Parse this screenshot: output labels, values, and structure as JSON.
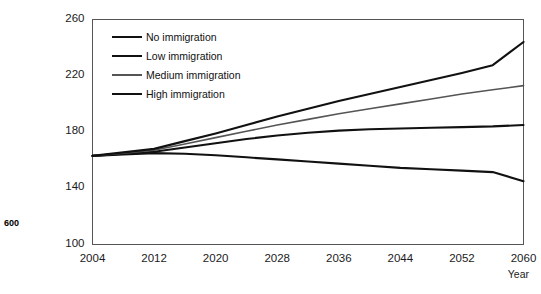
{
  "side_note": "600",
  "chart_data": {
    "type": "line",
    "title": "",
    "xlabel": "Year",
    "ylabel": "",
    "xlim": [
      2004,
      2060
    ],
    "ylim": [
      100,
      260
    ],
    "xticks": [
      2004,
      2012,
      2020,
      2028,
      2036,
      2044,
      2052,
      2060
    ],
    "yticks": [
      100,
      140,
      180,
      220,
      260
    ],
    "grid": false,
    "legend_position": "upper-left-inside",
    "x": [
      2004,
      2008,
      2012,
      2016,
      2020,
      2024,
      2028,
      2032,
      2036,
      2040,
      2044,
      2048,
      2052,
      2056,
      2060
    ],
    "series": [
      {
        "name": "No immigration",
        "color": "#111111",
        "width": 2.1,
        "values": [
          163,
          164,
          165,
          164.5,
          163.5,
          162,
          160.5,
          159,
          157.5,
          156,
          154.5,
          153.5,
          152.5,
          151.5,
          145
        ]
      },
      {
        "name": "Low immigration",
        "color": "#111111",
        "width": 2.1,
        "values": [
          163,
          164.5,
          166,
          169,
          172,
          175,
          177.5,
          179.5,
          181,
          182,
          182.5,
          183,
          183.5,
          184,
          185
        ]
      },
      {
        "name": "Medium immigration",
        "color": "#555555",
        "width": 1.6,
        "values": [
          163,
          165,
          167,
          171.5,
          176,
          180.5,
          185,
          189,
          193,
          196.5,
          200,
          203.5,
          207,
          210,
          213
        ]
      },
      {
        "name": "High immigration",
        "color": "#111111",
        "width": 2.1,
        "values": [
          163,
          165.5,
          168,
          173.5,
          179,
          185,
          191,
          196.5,
          202,
          207,
          212,
          217,
          222,
          227.5,
          244
        ]
      }
    ]
  }
}
